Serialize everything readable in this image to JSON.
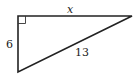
{
  "diagram": {
    "type": "right-triangle",
    "vertices": {
      "right_angle": [
        18,
        16
      ],
      "top_right": [
        132,
        16
      ],
      "bottom_left": [
        18,
        72
      ]
    },
    "labels": {
      "top_side": "x",
      "left_side": "6",
      "hypotenuse": "13"
    },
    "right_angle_marker": true,
    "colors": {
      "stroke": "#222222",
      "background": "#ffffff"
    }
  }
}
